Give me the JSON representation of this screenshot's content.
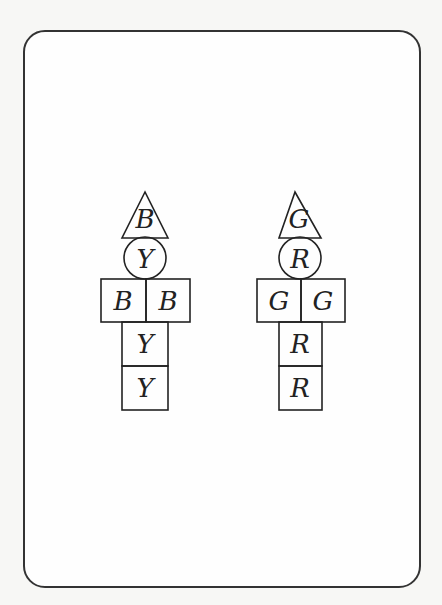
{
  "figures": [
    {
      "name": "left-figure",
      "hat": "B",
      "head": "Y",
      "left_arm": "B",
      "right_arm": "B",
      "body_upper": "Y",
      "body_lower": "Y"
    },
    {
      "name": "right-figure",
      "hat": "G",
      "head": "R",
      "left_arm": "G",
      "right_arm": "G",
      "body_upper": "R",
      "body_lower": "R"
    }
  ]
}
